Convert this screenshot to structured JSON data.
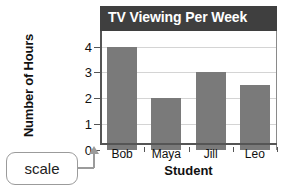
{
  "chart_data": {
    "type": "bar",
    "title": "TV Viewing Per Week",
    "xlabel": "Student",
    "ylabel": "Number of Hours",
    "categories": [
      "Bob",
      "Maya",
      "Jill",
      "Leo"
    ],
    "values": [
      4,
      2,
      3,
      2.5
    ],
    "ytick_labels": [
      "0",
      "1",
      "2",
      "3",
      "4"
    ],
    "ytick_values": [
      0,
      1,
      2,
      3,
      4
    ],
    "ylim": [
      0,
      4.6
    ],
    "grid": "horizontal",
    "legend": "none",
    "bar_color": "#7a7a7a",
    "title_bar_color": "#3f3f3f",
    "title_text_color": "#ffffff",
    "gridline_color": "#d4d4d4",
    "axis_color": "#555555"
  },
  "annotation": {
    "label": "scale",
    "border_color": "#9b9b9b",
    "points_to": "y-axis"
  }
}
